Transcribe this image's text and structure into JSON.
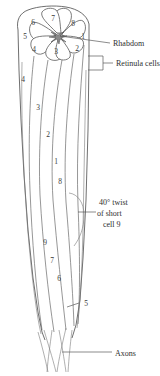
{
  "figure": {
    "background_color": "#ffffff",
    "line_color": "#4a4a4a",
    "text_color": "#2e2e2e"
  },
  "callouts": [
    {
      "id": "rhabdom",
      "label": "Rhabdom"
    },
    {
      "id": "retinula",
      "label": "Retinula cells"
    },
    {
      "id": "axons",
      "label": "Axons"
    }
  ],
  "twist_note": {
    "line1": "40° twist",
    "line2": "of short",
    "line3": "cell 9"
  },
  "rosette_cells": [
    {
      "n": "6",
      "x": 33,
      "y": 25
    },
    {
      "n": "7",
      "x": 53,
      "y": 21
    },
    {
      "n": "8",
      "x": 73,
      "y": 26
    },
    {
      "n": "5",
      "x": 25,
      "y": 39
    },
    {
      "n": "1",
      "x": 83,
      "y": 39
    },
    {
      "n": "4",
      "x": 34,
      "y": 52
    },
    {
      "n": "3",
      "x": 56,
      "y": 54
    },
    {
      "n": "2",
      "x": 77,
      "y": 51
    }
  ],
  "body_cells": [
    {
      "n": "4",
      "x": 23,
      "y": 82
    },
    {
      "n": "3",
      "x": 38,
      "y": 110
    },
    {
      "n": "2",
      "x": 48,
      "y": 137
    },
    {
      "n": "1",
      "x": 56,
      "y": 164
    },
    {
      "n": "8",
      "x": 60,
      "y": 184
    },
    {
      "n": "9",
      "x": 45,
      "y": 245
    },
    {
      "n": "7",
      "x": 52,
      "y": 263
    },
    {
      "n": "6",
      "x": 59,
      "y": 281
    },
    {
      "n": "5",
      "x": 75,
      "y": 303
    }
  ]
}
